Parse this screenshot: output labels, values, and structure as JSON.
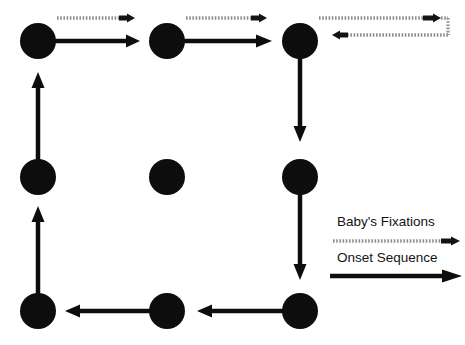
{
  "figure": {
    "width": 465,
    "height": 345,
    "background_color": "#ffffff",
    "dot_color": "#0d0d0d",
    "solid_arrow_color": "#0d0d0d",
    "dotted_arrow_color": "#8e8e8e",
    "dotted_arrowhead_color": "#141414",
    "dot_radius": 18
  },
  "legend": {
    "items": [
      {
        "label": "Baby's Fixations",
        "marker": "dotted-arrow-right",
        "label_x": 337,
        "label_y": 222,
        "marker_y": 241,
        "marker_x_start": 333,
        "marker_x_end": 462
      },
      {
        "label": "Onset Sequence",
        "marker": "solid-arrow-right",
        "label_x": 337,
        "label_y": 258,
        "marker_y": 276,
        "marker_x_start": 330,
        "marker_x_end": 462
      }
    ]
  },
  "dots": [
    {
      "id": "dot-top-left",
      "row": "top",
      "col": "left",
      "cx": 38,
      "cy": 41
    },
    {
      "id": "dot-top-center",
      "row": "top",
      "col": "center",
      "cx": 167,
      "cy": 41
    },
    {
      "id": "dot-top-right",
      "row": "top",
      "col": "right",
      "cx": 300,
      "cy": 41
    },
    {
      "id": "dot-middle-left",
      "row": "middle",
      "col": "left",
      "cx": 38,
      "cy": 177
    },
    {
      "id": "dot-middle-center",
      "row": "middle",
      "col": "center",
      "cx": 167,
      "cy": 177
    },
    {
      "id": "dot-middle-right",
      "row": "middle",
      "col": "right",
      "cx": 300,
      "cy": 177
    },
    {
      "id": "dot-bottom-left",
      "row": "bottom",
      "col": "left",
      "cx": 38,
      "cy": 311
    },
    {
      "id": "dot-bottom-center",
      "row": "bottom",
      "col": "center",
      "cx": 167,
      "cy": 311
    },
    {
      "id": "dot-bottom-right",
      "row": "bottom",
      "col": "right",
      "cx": 300,
      "cy": 311
    }
  ],
  "solid_arrows": [
    {
      "id": "arrow-top-left-to-top-center",
      "x1": 44,
      "y1": 41,
      "x2": 136,
      "y2": 41,
      "direction": "right"
    },
    {
      "id": "arrow-top-center-to-top-right",
      "x1": 173,
      "y1": 41,
      "x2": 270,
      "y2": 41,
      "direction": "right"
    },
    {
      "id": "arrow-top-right-to-middle-right",
      "x1": 300,
      "y1": 47,
      "x2": 300,
      "y2": 139,
      "direction": "down"
    },
    {
      "id": "arrow-middle-right-to-bottom-right",
      "x1": 300,
      "y1": 183,
      "x2": 300,
      "y2": 277,
      "direction": "down"
    },
    {
      "id": "arrow-bottom-right-to-bottom-center",
      "x1": 294,
      "y1": 311,
      "x2": 200,
      "y2": 311,
      "direction": "left"
    },
    {
      "id": "arrow-bottom-center-to-bottom-left",
      "x1": 161,
      "y1": 311,
      "x2": 68,
      "y2": 311,
      "direction": "left"
    },
    {
      "id": "arrow-bottom-left-to-middle-left",
      "x1": 38,
      "y1": 305,
      "x2": 38,
      "y2": 209,
      "direction": "up"
    },
    {
      "id": "arrow-middle-left-to-top-left",
      "x1": 38,
      "y1": 171,
      "x2": 38,
      "y2": 74,
      "direction": "up"
    }
  ],
  "dotted_arrows": [
    {
      "id": "fixation-top-left",
      "type": "straight",
      "x1": 57,
      "y1": 18,
      "x2": 133,
      "y2": 18,
      "direction": "right"
    },
    {
      "id": "fixation-top-center",
      "type": "straight",
      "x1": 186,
      "y1": 18,
      "x2": 265,
      "y2": 18,
      "direction": "right"
    },
    {
      "id": "fixation-top-right-uturn",
      "type": "uturn",
      "out_x1": 319,
      "out_y": 18,
      "out_x2": 436,
      "corner_x": 448,
      "corner_y_top": 18,
      "corner_y_bottom": 35,
      "back_x1": 448,
      "back_y": 35,
      "back_x2": 333,
      "direction": "right-then-down-then-left"
    }
  ]
}
